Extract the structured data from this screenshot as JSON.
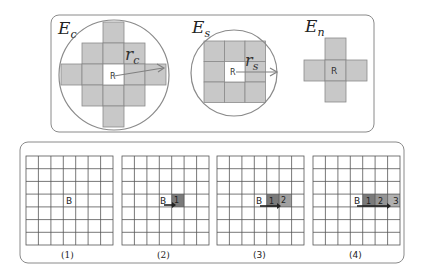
{
  "top_panel": {
    "neighborhoods": [
      {
        "id": "Ec",
        "title_main": "E",
        "title_sub": "c",
        "center_label": "R",
        "radius_main": "r",
        "radius_sub": "c",
        "shape": "circle-cross"
      },
      {
        "id": "Es",
        "title_main": "E",
        "title_sub": "s",
        "center_label": "R",
        "radius_main": "r",
        "radius_sub": "s",
        "shape": "circle-square"
      },
      {
        "id": "En",
        "title_main": "E",
        "title_sub": "n",
        "center_label": "R",
        "shape": "cross"
      }
    ]
  },
  "bottom_panel": {
    "grid_size": 7,
    "start_label": "B",
    "steps": [
      {
        "caption": "(1)",
        "marked": []
      },
      {
        "caption": "(2)",
        "marked": [
          "1"
        ]
      },
      {
        "caption": "(3)",
        "marked": [
          "1",
          "2"
        ]
      },
      {
        "caption": "(4)",
        "marked": [
          "1",
          "2",
          "3"
        ]
      }
    ]
  },
  "colors": {
    "cell_fill": "#c8c8c8",
    "cell_stroke": "#8a8a8a",
    "circle_stroke": "#8a8a8a",
    "panel_stroke": "#8a8a8a",
    "grid_stroke": "#555555",
    "marked_dark": "#7a7a7a",
    "marked_light": "#a8a8a8",
    "arrow": "#222222"
  }
}
